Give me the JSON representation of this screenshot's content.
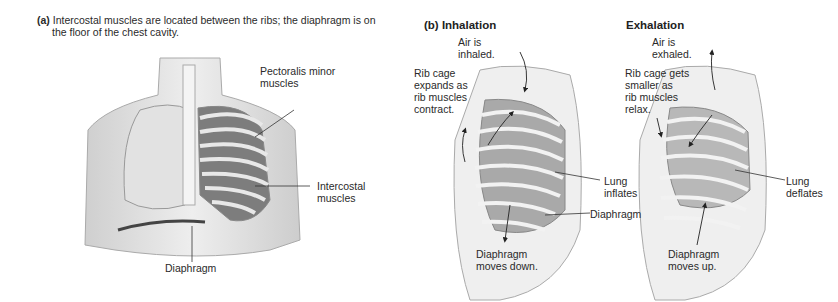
{
  "panel_a": {
    "tag": "(a)",
    "caption_line1": "Intercostal muscles are located between the ribs; the diaphragm is on",
    "caption_line2": "the floor of the chest cavity.",
    "labels": {
      "pectoralis": "Pectoralis minor\nmuscles",
      "intercostal": "Intercostal\nmuscles",
      "diaphragm": "Diaphragm"
    }
  },
  "panel_b": {
    "title": "(b) Inhalation",
    "labels": {
      "air": "Air is\ninhaled.",
      "rib": "Rib cage\nexpands as\nrib muscles\ncontract.",
      "lung": "Lung\ninflates",
      "diaphragm": "Diaphragm",
      "diaphragm_move": "Diaphragm\nmoves down."
    }
  },
  "panel_c": {
    "title": "Exhalation",
    "labels": {
      "air": "Air is\nexhaled.",
      "rib": "Rib cage gets\nsmaller as\nrib muscles\nrelax.",
      "lung": "Lung\ndeflates",
      "diaphragm_move": "Diaphragm\nmoves up."
    }
  }
}
